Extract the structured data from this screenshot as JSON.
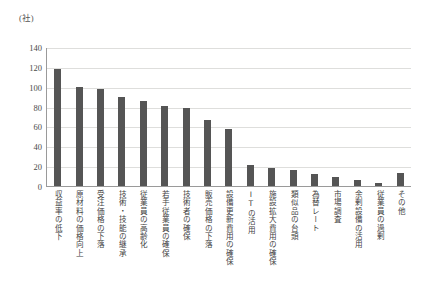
{
  "chart_data": {
    "type": "bar",
    "title": "",
    "xlabel": "",
    "ylabel": "(社)",
    "unit_label": "(社)",
    "ylim": [
      0,
      140
    ],
    "ytick_step": 20,
    "yticks": [
      140,
      120,
      100,
      80,
      60,
      40,
      20,
      0
    ],
    "grid": true,
    "legend": "none",
    "bar_color": "#555555",
    "gridline_color": "#dededc",
    "axis_color": "#9a9a9a",
    "categories": [
      "収益率の低下",
      "原材料の価格向上",
      "受注価格の下落",
      "技術・技能の継承",
      "従業員の高齢化",
      "若手従業員の確保",
      "技術者の確保",
      "販売価格の下落",
      "設備更新費用の確保",
      "ITの活用",
      "施設拡大費用の確保",
      "類似品の台頭",
      "為替レート",
      "市場調査",
      "余剰設備の活用",
      "従業員の過剰",
      "その他"
    ],
    "values": [
      118,
      100,
      98,
      90,
      86,
      81,
      79,
      66,
      57,
      21,
      18,
      16,
      12,
      9,
      6,
      3,
      13
    ]
  }
}
